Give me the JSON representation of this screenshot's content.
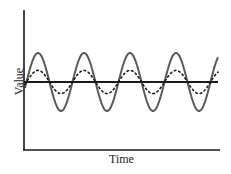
{
  "chart_data": {
    "type": "line",
    "title": "",
    "xlabel": "Time",
    "ylabel": "Value",
    "grid": false,
    "legend": null,
    "ticks": "none",
    "periods_visible": 4.2,
    "series": [
      {
        "name": "solid-wave",
        "style": "solid",
        "color": "#555555",
        "amplitude": 1.0,
        "cycles": 4.2,
        "phase": "starts near baseline rising"
      },
      {
        "name": "dotted-wave",
        "style": "dotted",
        "color": "#111111",
        "amplitude": 0.4,
        "cycles": 4.2,
        "phase": "in phase with solid-wave"
      },
      {
        "name": "baseline",
        "style": "solid",
        "color": "#111111",
        "value": 0
      }
    ],
    "x": [
      0,
      0.25,
      0.5,
      0.75,
      1,
      1.25,
      1.5,
      1.75,
      2,
      2.25,
      2.5,
      2.75,
      3,
      3.25,
      3.5,
      3.75,
      4,
      4.2
    ],
    "series_values": {
      "solid-wave": [
        0,
        1,
        0,
        -1,
        0,
        1,
        0,
        -1,
        0,
        1,
        0,
        -1,
        0,
        1,
        0,
        -1,
        0,
        0.95
      ],
      "dotted-wave": [
        0,
        0.4,
        0,
        -0.4,
        0,
        0.4,
        0,
        -0.4,
        0,
        0.4,
        0,
        -0.4,
        0,
        0.4,
        0,
        -0.4,
        0,
        0.38
      ],
      "baseline": [
        0,
        0,
        0,
        0,
        0,
        0,
        0,
        0,
        0,
        0,
        0,
        0,
        0,
        0,
        0,
        0,
        0,
        0
      ]
    },
    "ylim": [
      -2.2,
      2.2
    ]
  },
  "layout": {
    "axis_color": "#1a1a1a",
    "solid_wave_color": "#5a5a5a",
    "dotted_wave_color": "#1a1a1a"
  }
}
